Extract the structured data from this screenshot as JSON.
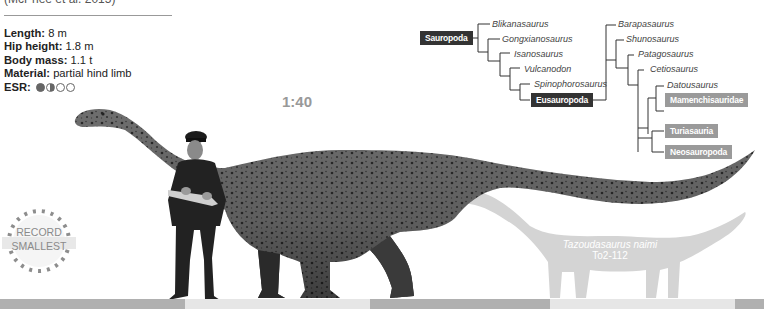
{
  "header": {
    "citation": "(McPhee et al. 2015)"
  },
  "stats": {
    "length_label": "Length:",
    "length_value": "8 m",
    "hip_label": "Hip height:",
    "hip_value": "1.8 m",
    "mass_label": "Body mass:",
    "mass_value": "1.1 t",
    "material_label": "Material:",
    "material_value": "partial hind limb",
    "esr_label": "ESR:",
    "esr_dots": [
      "full",
      "half",
      "empty",
      "empty"
    ]
  },
  "scale": {
    "ratio": "1:40"
  },
  "badge": {
    "line1": "RECORD",
    "line2": "SMALLEST"
  },
  "juvenile": {
    "label": "Juvenile",
    "species": "Tazoudasaurus naimi",
    "specimen": "To2-112"
  },
  "cladogram": {
    "root": "Sauropoda",
    "taxa": [
      "Blikanasaurus",
      "Gongxianosaurus",
      "Isanosaurus",
      "Vulcanodon",
      "Spinophorosaurus"
    ],
    "eusauropoda": "Eusauropoda",
    "eusauropod_taxa": [
      "Barapasaurus",
      "Shunosaurus",
      "Patagosaurus",
      "Cetiosaurus",
      "Datousaurus"
    ],
    "clades": [
      "Mamenchisauridae",
      "Turiasauria",
      "Neosauropoda"
    ]
  },
  "colors": {
    "dark_box": "#333333",
    "light_box": "#9a9a9a",
    "silhouette": "#d4d4d4",
    "scale_dark": "#b0b0b0",
    "scale_light": "#e6e6e6"
  },
  "scalebar": {
    "segments": [
      {
        "width": 185,
        "color": "#b0b0b0"
      },
      {
        "width": 185,
        "color": "#e6e6e6"
      },
      {
        "width": 180,
        "color": "#b0b0b0"
      },
      {
        "width": 185,
        "color": "#e6e6e6"
      },
      {
        "width": 29,
        "color": "#b0b0b0"
      }
    ]
  }
}
